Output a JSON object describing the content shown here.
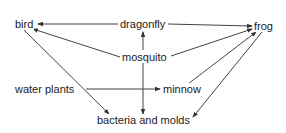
{
  "diagram": {
    "type": "food-web",
    "nodes": {
      "bird": "bird",
      "dragonfly": "dragonfly",
      "frog": "frog",
      "mosquito": "mosquito",
      "water_plants": "water plants",
      "minnow": "minnow",
      "bacteria": "bacteria and molds"
    },
    "edges": [
      {
        "from": "dragonfly",
        "to": "bird"
      },
      {
        "from": "dragonfly",
        "to": "frog"
      },
      {
        "from": "mosquito",
        "to": "bird"
      },
      {
        "from": "mosquito",
        "to": "frog"
      },
      {
        "from": "mosquito",
        "to": "dragonfly"
      },
      {
        "from": "mosquito",
        "to": "bacteria and molds"
      },
      {
        "from": "water plants",
        "to": "minnow"
      },
      {
        "from": "bird",
        "to": "bacteria and molds"
      },
      {
        "from": "minnow",
        "to": "frog"
      },
      {
        "from": "frog",
        "to": "bacteria and molds"
      }
    ],
    "colors": {
      "line": "#333333",
      "text": "#1a1a1a",
      "background": "#ffffff"
    }
  }
}
